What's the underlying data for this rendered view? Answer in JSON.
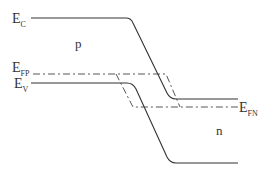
{
  "diagram": {
    "colors": {
      "line": "#333333",
      "background": "#ffffff"
    },
    "labels": {
      "ec": {
        "main": "E",
        "sub": "C"
      },
      "efp": {
        "main": "E",
        "sub": "FP"
      },
      "ev": {
        "main": "E",
        "sub": "V"
      },
      "efn": {
        "main": "E",
        "sub": "FN"
      },
      "p_region": "p",
      "n_region": "n"
    },
    "curves": [
      {
        "name": "conduction-band-edge",
        "style": "solid"
      },
      {
        "name": "valence-band-edge",
        "style": "solid"
      },
      {
        "name": "fermi-level-p",
        "style": "dash-dot"
      },
      {
        "name": "fermi-level-n",
        "style": "dash-dot"
      }
    ]
  }
}
